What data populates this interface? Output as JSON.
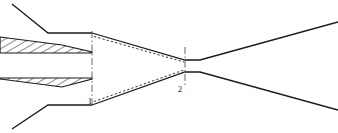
{
  "figure": {
    "kind": "engineering-cross-section-diagram",
    "background_color": "#ffffff",
    "line_color": "#1a1a1a",
    "hatch_color": "#1a1a1a",
    "width": 338,
    "height": 133,
    "axis_of_symmetry_y": 66
  },
  "station_labels": [
    {
      "id": "station-1",
      "text": "1",
      "x": 90,
      "y": 104
    },
    {
      "id": "station-2",
      "text": "2",
      "x": 180,
      "y": 92
    }
  ],
  "station_lines": [
    {
      "id": "station-line-1",
      "x": 92,
      "y_top": 31,
      "y_bottom": 107,
      "style": "dash-dot"
    },
    {
      "id": "station-line-2",
      "x": 185,
      "y_top": 47,
      "y_bottom": 85,
      "style": "dash-dot"
    }
  ],
  "hatched_wedges": [
    {
      "id": "upper-wedge",
      "points": "0,37 62,45 92,52 92,53 0,53",
      "hatch_angle_deg": 60
    },
    {
      "id": "lower-wedge",
      "points": "0,79 62,87 92,79 92,78 0,78",
      "hatch_angle_deg": 60
    }
  ],
  "contours": {
    "upper_solid": "92,33 185,60 200,60 338,22",
    "lower_solid": "92,105 185,72 200,72 338,110",
    "upper_dotted": "94,36 184,62",
    "lower_dotted": "94,102 184,70"
  },
  "external_lines": [
    {
      "id": "upper-cowl-diagonal",
      "path": "12,4 48,33 92,33"
    },
    {
      "id": "lower-cowl-diagonal",
      "path": "12,129 48,105 92,105"
    }
  ],
  "legend": {
    "note": "no legend rendered in figure"
  }
}
